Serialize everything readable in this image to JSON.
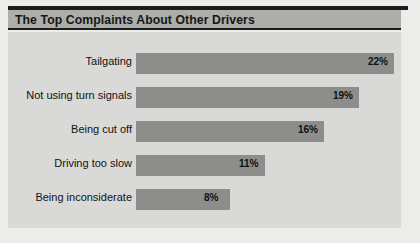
{
  "title": "The Top Complaints About Other Drivers",
  "colors": {
    "bar": "#8d8d8b",
    "panel_background": "#d9d9d7",
    "banner": "#adadaa",
    "rule": "#1c1c1c",
    "text": "#121212"
  },
  "chart_data": {
    "type": "bar",
    "orientation": "horizontal",
    "title": "The Top Complaints About Other Drivers",
    "xlabel": "",
    "ylabel": "",
    "grid": false,
    "legend": "none",
    "xlim": [
      0,
      24
    ],
    "unit": "%",
    "categories": [
      "Tailgating",
      "Not using turn signals",
      "Being cut off",
      "Driving too slow",
      "Being inconsiderate"
    ],
    "values": [
      22,
      19,
      16,
      11,
      8
    ],
    "value_labels": [
      "22%",
      "19%",
      "16%",
      "11%",
      "8%"
    ]
  }
}
